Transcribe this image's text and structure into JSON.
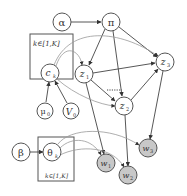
{
  "diagram": {
    "type": "probabilistic-graphical-model",
    "nodes": [
      {
        "id": "alpha",
        "label": "α",
        "sub": "",
        "x": 62,
        "y": 22,
        "observed": false
      },
      {
        "id": "pi",
        "label": "π",
        "sub": "",
        "x": 111,
        "y": 22,
        "observed": false
      },
      {
        "id": "c_k",
        "label": "c",
        "sub": "k",
        "x": 50,
        "y": 73,
        "observed": false
      },
      {
        "id": "z_1",
        "label": "z",
        "sub": "1",
        "x": 84,
        "y": 74,
        "observed": false
      },
      {
        "id": "z_2",
        "label": "z",
        "sub": "2",
        "x": 124,
        "y": 106,
        "observed": false
      },
      {
        "id": "z_3",
        "label": "z",
        "sub": "3",
        "x": 165,
        "y": 62,
        "observed": false
      },
      {
        "id": "mu_0",
        "label": "μ",
        "sub": "0",
        "x": 45,
        "y": 111,
        "observed": false
      },
      {
        "id": "V_0",
        "label": "V",
        "sub": "0",
        "x": 71,
        "y": 111,
        "observed": false
      },
      {
        "id": "beta",
        "label": "β",
        "sub": "",
        "x": 21,
        "y": 152,
        "observed": false
      },
      {
        "id": "theta_k",
        "label": "θ",
        "sub": "k",
        "x": 52,
        "y": 152,
        "observed": false
      },
      {
        "id": "w_1",
        "label": "w",
        "sub": "1",
        "x": 106,
        "y": 163,
        "observed": true
      },
      {
        "id": "w_2",
        "label": "w",
        "sub": "2",
        "x": 128,
        "y": 175,
        "observed": true
      },
      {
        "id": "w_3",
        "label": "w",
        "sub": "3",
        "x": 148,
        "y": 148,
        "observed": true
      }
    ],
    "plates": [
      {
        "id": "plate-c",
        "label": "k∈[1,K]",
        "x": 30,
        "y": 34,
        "w": 43,
        "h": 45,
        "label_pos": "top"
      },
      {
        "id": "plate-theta",
        "label": "k∈[1,K]",
        "x": 38,
        "y": 137,
        "w": 36,
        "h": 44,
        "label_pos": "bottom"
      }
    ],
    "edges": [
      {
        "from": "alpha",
        "to": "pi"
      },
      {
        "from": "pi",
        "to": "z_1"
      },
      {
        "from": "pi",
        "to": "z_2"
      },
      {
        "from": "pi",
        "to": "z_3"
      },
      {
        "from": "z_1",
        "to": "z_3"
      },
      {
        "from": "z_1",
        "to": "z_2"
      },
      {
        "from": "z_2",
        "to": "z_3"
      },
      {
        "from": "z_1",
        "to": "w_1"
      },
      {
        "from": "z_2",
        "to": "w_2"
      },
      {
        "from": "z_3",
        "to": "w_3"
      },
      {
        "from": "mu_0",
        "to": "c_k"
      },
      {
        "from": "V_0",
        "to": "c_k"
      },
      {
        "from": "beta",
        "to": "theta_k"
      }
    ],
    "dotted_label": "......",
    "colors": {
      "stroke": "#555555",
      "observed_fill": "#c8c8c8",
      "latent_fill": "#ffffff",
      "curve": "#999999"
    }
  }
}
